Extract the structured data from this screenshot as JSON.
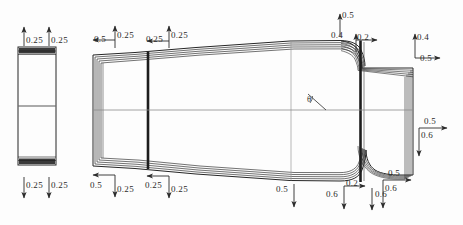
{
  "drawing": {
    "title": "Axisymmetric nozzle mesh cross-section",
    "background_color": "#fdfdfd",
    "line_color": "#262626",
    "centerline_color": "#7a7a7a",
    "annotation_color": "#2b2b2b"
  },
  "dimensions": {
    "inlet_detail_top_left": "0.25",
    "inlet_detail_top_right": "0.25",
    "inlet_detail_bottom_left": "0.25",
    "inlet_detail_bottom_right": "0.25",
    "body_top_left_horizontal": "0.5",
    "body_top_left_vertical": "0.25",
    "body_top_mid_horizontal": "0.25",
    "body_top_mid_vertical": "0.25",
    "body_bottom_left_horizontal": "0.5",
    "body_bottom_left_vertical": "0.25",
    "body_bottom_mid_horizontal": "0.25",
    "body_bottom_mid_vertical": "0.25",
    "throat_top_vertical": "0.5",
    "throat_top_left_value": "0.4",
    "throat_top_right_value": "0.2",
    "exit_axis_vertical": "0.4",
    "exit_axis_horizontal": "0.5",
    "exit_right_horizontal": "0.5",
    "exit_right_vertical": "0.6",
    "bottom_mid_vertical": "0.5",
    "bottom_flare_left_vertical": "0.6",
    "bottom_flare_horizontal": "0.2",
    "bottom_outer_vertical": "0.6",
    "bottom_right_horizontal": "0.5",
    "bottom_right_vertical": "0.6"
  },
  "angle_marker": {
    "symbol": "θ"
  }
}
